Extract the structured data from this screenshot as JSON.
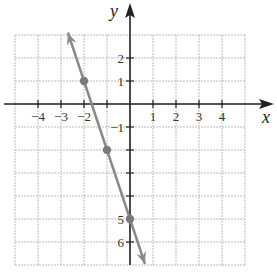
{
  "chart_data": {
    "type": "line",
    "title": "",
    "xlabel": "x",
    "ylabel": "y",
    "xlim": [
      -5,
      5
    ],
    "ylim": [
      -7,
      3
    ],
    "grid": true,
    "x_ticks": [
      -4,
      -3,
      -2,
      1,
      2,
      3,
      4
    ],
    "x_tick_labels": [
      "−4",
      "−3",
      "−2",
      "1",
      "2",
      "3",
      "4"
    ],
    "y_ticks": [
      2,
      1,
      -1,
      -5,
      -6
    ],
    "y_tick_labels": [
      "2",
      "1",
      "−1",
      "5",
      "6"
    ],
    "series": [
      {
        "name": "line",
        "equation": "y = -3x - 5",
        "color": "#888888",
        "arrows": "both",
        "x_range": [
          -2.7,
          0.65
        ],
        "points": [
          {
            "x": -2,
            "y": 1
          },
          {
            "x": -1,
            "y": -2
          },
          {
            "x": 0,
            "y": -5
          }
        ]
      }
    ],
    "legend": null
  },
  "colors": {
    "grid": "#bbbbbb",
    "axis": "#222222",
    "line": "#8a8a8a",
    "point": "#7a7a7a"
  },
  "labels": {
    "x_axis": "x",
    "y_axis": "y"
  }
}
